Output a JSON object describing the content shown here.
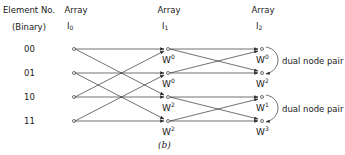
{
  "header": {
    "element_no": "Element No.",
    "binary": "(Binary)",
    "arrays": [
      {
        "label": "Array",
        "name": "I",
        "index": "0"
      },
      {
        "label": "Array",
        "name": "I",
        "index": "1"
      },
      {
        "label": "Array",
        "name": "I",
        "index": "2"
      }
    ]
  },
  "rows": [
    {
      "binary": "00"
    },
    {
      "binary": "01"
    },
    {
      "binary": "10"
    },
    {
      "binary": "11"
    }
  ],
  "array1_weights": [
    {
      "base": "W",
      "exp": "0"
    },
    {
      "base": "W",
      "exp": "0"
    },
    {
      "base": "W",
      "exp": "2"
    },
    {
      "base": "W",
      "exp": "2"
    }
  ],
  "array2_weights": [
    {
      "base": "W",
      "exp": "0"
    },
    {
      "base": "W",
      "exp": "2"
    },
    {
      "base": "W",
      "exp": "1"
    },
    {
      "base": "W",
      "exp": "3"
    }
  ],
  "dual_node_pairs": [
    {
      "label": "dual node pair",
      "nodes": [
        0,
        1
      ]
    },
    {
      "label": "dual node pair",
      "nodes": [
        2,
        3
      ]
    }
  ],
  "caption": "(b)",
  "colors": {
    "line": "#333333",
    "text": "#1a1a1a"
  }
}
